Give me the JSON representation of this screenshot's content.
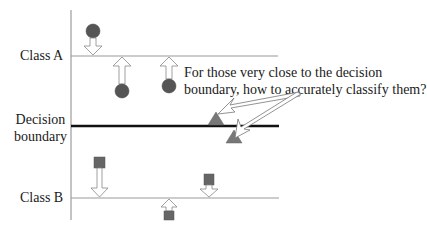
{
  "labels": {
    "class_a": "Class A",
    "decision_line1": "Decision",
    "decision_line2": "boundary",
    "class_b": "Class B"
  },
  "annotation": {
    "line1": "For those very close to the decision",
    "line2": "boundary, how to accurately classify them?"
  },
  "colors": {
    "circle": "#555555",
    "triangle": "#777777",
    "square": "#666666",
    "boundary": "#111111",
    "axis": "#888888"
  },
  "elements": {
    "class_a_points": [
      "circle",
      "circle",
      "circle"
    ],
    "boundary_points": [
      "triangle",
      "triangle"
    ],
    "class_b_points": [
      "square",
      "square",
      "square"
    ]
  }
}
